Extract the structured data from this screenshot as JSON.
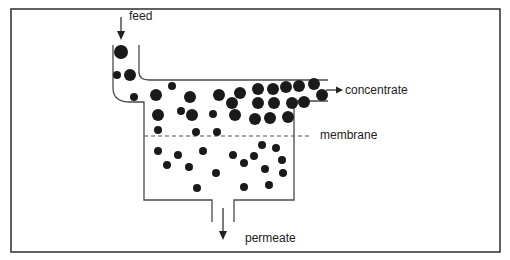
{
  "diagram": {
    "labels": {
      "feed": "feed",
      "concentrate": "concentrate",
      "membrane": "membrane",
      "permeate": "permeate"
    },
    "colors": {
      "particle": "#1a1a1a",
      "wall": "#4a4a4a",
      "frame": "#3a3a3a"
    },
    "large_particles": [
      [
        121,
        52,
        7
      ],
      [
        130,
        75,
        6
      ],
      [
        156,
        95,
        6
      ],
      [
        190,
        97,
        6
      ],
      [
        219,
        95,
        6
      ],
      [
        240,
        93,
        6
      ],
      [
        258,
        89,
        6
      ],
      [
        273,
        89,
        6
      ],
      [
        286,
        87,
        6
      ],
      [
        299,
        86,
        6
      ],
      [
        314,
        84,
        6
      ],
      [
        322,
        95,
        6
      ],
      [
        232,
        103,
        6
      ],
      [
        258,
        103,
        6
      ],
      [
        274,
        103,
        6
      ],
      [
        292,
        103,
        6
      ],
      [
        304,
        102,
        6
      ],
      [
        158,
        115,
        6
      ],
      [
        192,
        115,
        6
      ],
      [
        235,
        115,
        6
      ],
      [
        255,
        119,
        6
      ],
      [
        270,
        118,
        6
      ],
      [
        288,
        117,
        6
      ]
    ],
    "small_particles": [
      [
        117,
        75,
        4
      ],
      [
        134,
        97,
        4
      ],
      [
        172,
        86,
        4
      ],
      [
        158,
        130,
        4
      ],
      [
        181,
        111,
        4
      ],
      [
        213,
        114,
        4
      ],
      [
        196,
        132,
        4
      ],
      [
        217,
        132,
        4
      ],
      [
        158,
        151,
        4
      ],
      [
        178,
        155,
        4
      ],
      [
        203,
        151,
        4
      ],
      [
        233,
        155,
        4
      ],
      [
        262,
        145,
        4
      ],
      [
        276,
        148,
        4
      ],
      [
        254,
        156,
        4
      ],
      [
        282,
        160,
        4
      ],
      [
        167,
        165,
        4
      ],
      [
        189,
        167,
        4
      ],
      [
        216,
        173,
        4
      ],
      [
        244,
        163,
        4
      ],
      [
        265,
        169,
        4
      ],
      [
        283,
        173,
        4
      ],
      [
        269,
        185,
        4
      ],
      [
        244,
        187,
        4
      ],
      [
        197,
        188,
        4
      ]
    ]
  }
}
